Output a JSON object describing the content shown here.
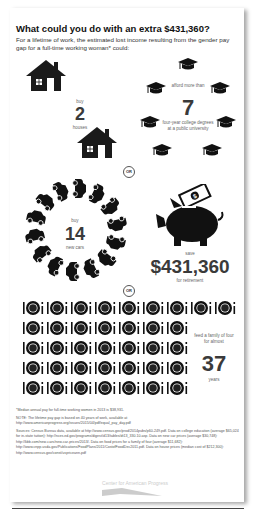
{
  "header": {
    "title": "What could you do with an extra $431,360?",
    "subtitle": "For a lifetime of work, the estimated lost income resulting from the gender pay gap for a full-time working woman* could:"
  },
  "houses": {
    "verb": "buy",
    "number": "2",
    "noun": "houses",
    "icon": "house-icon"
  },
  "college": {
    "verb": "afford more than",
    "number": "7",
    "noun": "four-year college degrees at a public university",
    "icon": "graduation-cap-icon"
  },
  "separator": "OR",
  "cars": {
    "verb": "buy",
    "number": "14",
    "noun": "new cars",
    "icon": "car-icon"
  },
  "retirement": {
    "verb": "save",
    "number": "$431,360",
    "noun": "for retirement",
    "icon": "piggy-bank-icon"
  },
  "food": {
    "verb": "feed a family of four for almost",
    "number": "37",
    "noun": "years",
    "icon": "plate-icon",
    "rows": [
      9,
      7,
      7,
      7,
      7
    ]
  },
  "notes": {
    "footnote": "*Median annual pay for full-time working women in 2013 is $38,931.",
    "note": "NOTE: The lifetime pay gap is based on 40 years of work, available at http://www.americanprogress.org/issues/2015/04/pdf/equal_pay_day.pdf",
    "sources": "Sources: Census Bureau data, available at http://www.census.gov/prod/2014pubs/p60-249.pdf. Data on college education (average $65,024 for in-state tuition): http://nces.ed.gov/programs/digest/d13/tables/dt13_330.10.asp. Data on new car prices (average $30,748): http://kbb.com/new-cars/new-car-prices/2013/. Data on food prices for a family of four (average $11,682): http://www.cnpp.usda.gov/Publications/FoodPlans/2011/CostofFoodDec2011.pdf. Data on house prices (median cost of $212,300): http://www.census.gov/const/uspriceann.pdf"
  },
  "logo": {
    "text": "Center for American Progress"
  }
}
